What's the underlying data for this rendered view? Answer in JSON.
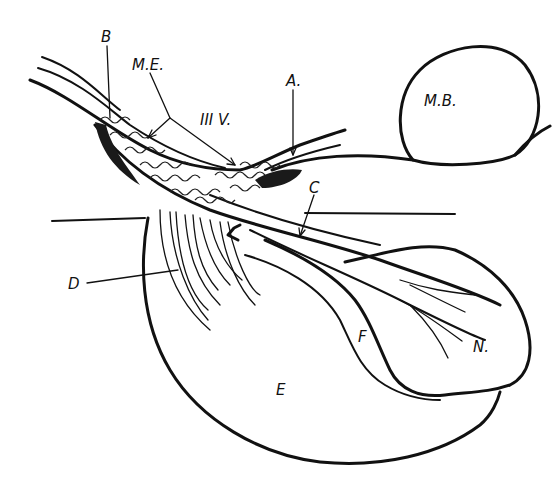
{
  "figure": {
    "type": "anatomical line drawing",
    "colors": {
      "ink": "#111111",
      "background": "#ffffff"
    }
  },
  "labels": {
    "B": "B",
    "ME": "M.E.",
    "IIIV": "III V.",
    "A": "A.",
    "MB": "M.B.",
    "C": "C",
    "D": "D",
    "E": "E",
    "F": "F",
    "N": "N."
  }
}
